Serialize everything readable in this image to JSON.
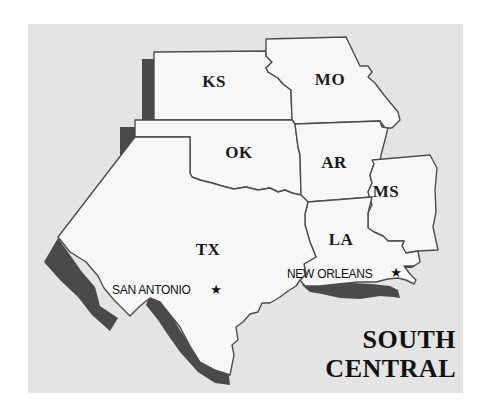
{
  "map": {
    "title_lines": [
      "SOUTH",
      "CENTRAL"
    ],
    "states": [
      {
        "abbr": "KS",
        "name": "Kansas",
        "label_x": 214,
        "label_y": 82
      },
      {
        "abbr": "MO",
        "name": "Missouri",
        "label_x": 330,
        "label_y": 80
      },
      {
        "abbr": "OK",
        "name": "Oklahoma",
        "label_x": 239,
        "label_y": 153
      },
      {
        "abbr": "AR",
        "name": "Arkansas",
        "label_x": 333,
        "label_y": 163
      },
      {
        "abbr": "MS",
        "name": "Mississippi",
        "label_x": 385,
        "label_y": 192
      },
      {
        "abbr": "LA",
        "name": "Louisiana",
        "label_x": 340,
        "label_y": 240
      },
      {
        "abbr": "TX",
        "name": "Texas",
        "label_x": 208,
        "label_y": 250
      }
    ],
    "cities": [
      {
        "name": "SAN ANTONIO",
        "label_x": 112,
        "label_y": 290,
        "star_x": 216,
        "star_y": 290
      },
      {
        "name": "NEW ORLEANS",
        "label_x": 287,
        "label_y": 274,
        "star_x": 396,
        "star_y": 273
      }
    ],
    "star_glyph": "★",
    "colors": {
      "background": "#e4e4e4",
      "land": "#f7f7f7",
      "border": "#4d4d4d",
      "shadow": "#4a4a4a",
      "text": "#111111"
    }
  }
}
